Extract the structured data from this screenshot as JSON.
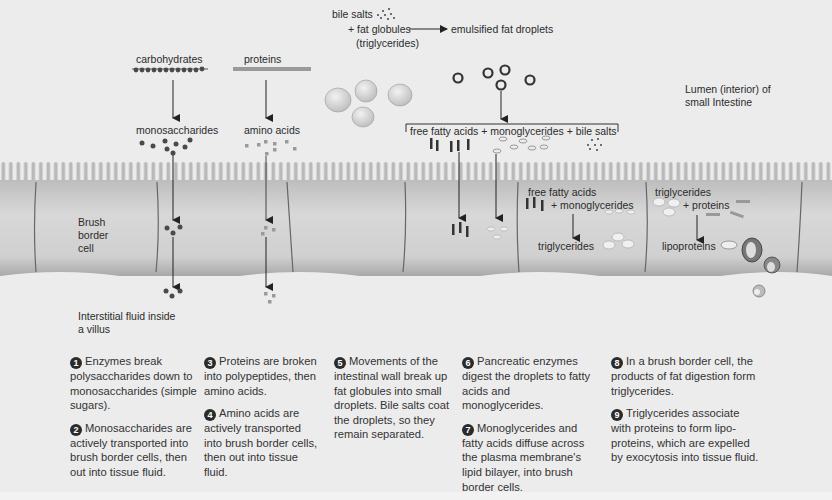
{
  "diagram": {
    "labels": {
      "carbohydrates": "carbohydrates",
      "proteins": "proteins",
      "monosaccharides": "monosaccharides",
      "amino_acids": "amino acids",
      "bile_salts": "bile salts",
      "fat_globules": "+ fat globules",
      "triglycerides_paren": "(triglycerides)",
      "emulsified": "emulsified fat droplets",
      "lumen_line1": "Lumen (interior) of",
      "lumen_line2": "small Intestine",
      "bracket_products": "free fatty acids + monoglycerides + bile salts",
      "brush_border_1": "Brush",
      "brush_border_2": "border",
      "brush_border_3": "cell",
      "cell_ffa": "free fatty acids",
      "cell_mono": "+ monoglycerides",
      "cell_trig": "triglycerides",
      "cell2_trig": "triglycerides",
      "cell2_proteins": "+ proteins",
      "lipoproteins": "lipoproteins",
      "interstitial_1": "Interstitial fluid inside",
      "interstitial_2": "a villus"
    },
    "colors": {
      "background": "#ececec",
      "cell_fill": "#c9c9c9",
      "cell_border": "#555555",
      "monosaccharide_dot": "#4a4a4a",
      "amino_acid_dot": "#9a9a9a",
      "arrow": "#222222"
    }
  },
  "steps": [
    {
      "num": "1",
      "text": "Enzymes break polysaccharides down to monosaccharides (simple sugars)."
    },
    {
      "num": "2",
      "text": "Monosaccharides are actively transported into brush border cells, then out into tissue fluid."
    },
    {
      "num": "3",
      "text": "Proteins are broken into polypeptides, then amino acids."
    },
    {
      "num": "4",
      "text": "Amino acids are actively transported into brush border cells, then out into tissue fluid."
    },
    {
      "num": "5",
      "text": "Movements of the intestinal wall break up fat globules into small droplets. Bile salts coat the droplets, so they remain separated."
    },
    {
      "num": "6",
      "text": "Pancreatic enzymes digest the droplets to fatty acids and monoglycerides."
    },
    {
      "num": "7",
      "text": "Monoglycerides and fatty acids diffuse across the plasma membrane's lipid bilayer, into brush border cells."
    },
    {
      "num": "8",
      "text": "In a brush border cell, the products of fat digestion form triglycerides."
    },
    {
      "num": "9",
      "text": "Triglycerides associate with proteins to form lipo-proteins, which are expelled by exocytosis into tissue fluid."
    }
  ]
}
